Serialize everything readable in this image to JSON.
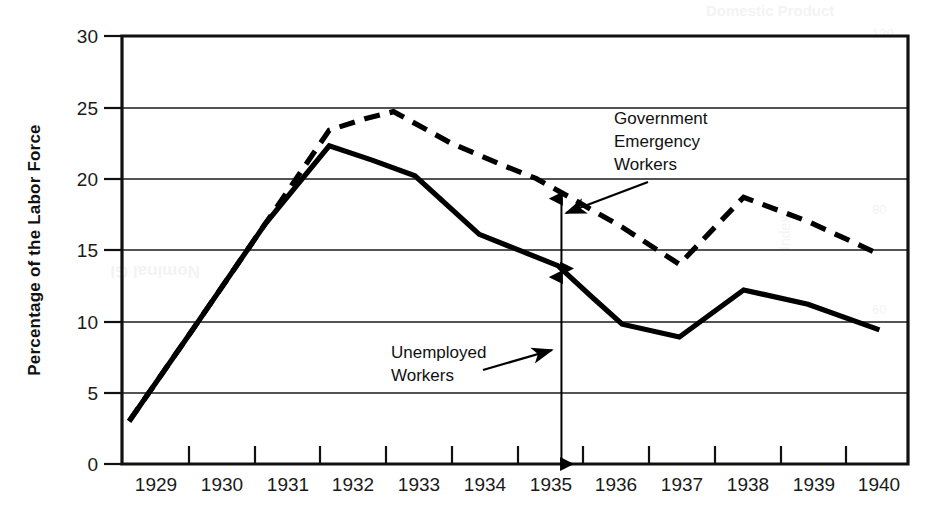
{
  "chart_data": {
    "type": "line",
    "title": "",
    "xlabel": "",
    "ylabel": "Percentage of the Labor Force",
    "ylim": [
      0,
      30
    ],
    "xlim": [
      1929,
      1940
    ],
    "grid": true,
    "legend_position": "none",
    "y_ticks": [
      "0",
      "5",
      "10",
      "15",
      "20",
      "25",
      "30"
    ],
    "y_tick_values": [
      0,
      5,
      10,
      15,
      20,
      25,
      30
    ],
    "x_ticks": [
      "1929",
      "1930",
      "1931",
      "1932",
      "1933",
      "1934",
      "1935",
      "1936",
      "1937",
      "1938",
      "1939",
      "1940"
    ],
    "x_tick_values": [
      1929,
      1930,
      1931,
      1932,
      1933,
      1934,
      1935,
      1936,
      1937,
      1938,
      1939,
      1940
    ],
    "series": [
      {
        "name": "Unemployed Workers",
        "style": "solid",
        "x": [
          1929.1,
          1930.0,
          1931.0,
          1931.9,
          1932.5,
          1933.1,
          1934.0,
          1934.6,
          1935.1,
          1935.6,
          1936.0,
          1936.8,
          1937.7,
          1938.6,
          1939.6
        ],
        "values": [
          3.0,
          9.5,
          16.8,
          22.3,
          21.3,
          20.2,
          16.1,
          14.9,
          13.9,
          11.6,
          9.8,
          8.9,
          12.2,
          11.2,
          9.4
        ]
      },
      {
        "name": "Government Emergency Workers",
        "style": "dashed",
        "x": [
          1929.1,
          1930.0,
          1931.0,
          1931.9,
          1932.4,
          1932.8,
          1933.6,
          1934.3,
          1934.8,
          1935.3,
          1936.0,
          1936.8,
          1937.7,
          1938.6,
          1939.6
        ],
        "values": [
          3.0,
          9.5,
          16.8,
          23.4,
          24.2,
          24.7,
          22.5,
          21.0,
          20.0,
          18.6,
          16.6,
          14.0,
          18.7,
          17.0,
          14.7
        ]
      }
    ],
    "annotations": [
      {
        "id": "government-emergency-workers",
        "lines": [
          "Government",
          "Emergency",
          "Workers"
        ],
        "text": "Government Emergency Workers",
        "points_to_series": "Government Emergency Workers"
      },
      {
        "id": "unemployed-workers",
        "lines": [
          "Unemployed",
          "Workers"
        ],
        "text": "Unemployed Workers",
        "points_to_series": "Unemployed Workers"
      }
    ],
    "measures": [
      {
        "id": "emergency-workers-band",
        "x": 1935.15,
        "from": 13.7,
        "to": 18.6,
        "description": "Double-headed arrow spanning the gap between the solid and dashed lines"
      },
      {
        "id": "unemployed-workers-band",
        "x": 1935.15,
        "from": 0.0,
        "to": 13.1,
        "description": "Double-headed arrow spanning from the axis baseline to the solid line"
      }
    ]
  }
}
